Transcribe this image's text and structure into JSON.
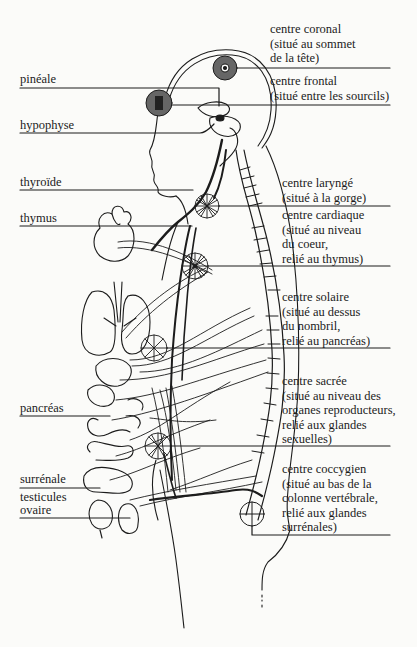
{
  "diagram": {
    "type": "anatomical chakra / endocrine gland diagram",
    "colors": {
      "ink": "#1c1c1c",
      "paper": "#fbfbf9",
      "chakra_fill": "#555555"
    },
    "left_labels": [
      {
        "id": "pineale",
        "text": "pinéale"
      },
      {
        "id": "hypophyse",
        "text": "hypophyse"
      },
      {
        "id": "thyroide",
        "text": "thyroïde"
      },
      {
        "id": "thymus",
        "text": "thymus"
      },
      {
        "id": "pancreas",
        "text": "pancréas"
      },
      {
        "id": "surrenale",
        "text": "surrénale"
      },
      {
        "id": "testicules",
        "text": "testicules"
      },
      {
        "id": "ovaire",
        "text": "ovaire"
      }
    ],
    "right_labels": [
      {
        "id": "coronal",
        "lines": [
          "centre coronal",
          "(situé au sommet",
          "de la tête)"
        ]
      },
      {
        "id": "frontal",
        "lines": [
          "centre frontal",
          "(situé entre les sourcils)"
        ]
      },
      {
        "id": "larynge",
        "lines": [
          "centre  laryngé",
          "(situé à la gorge)"
        ]
      },
      {
        "id": "cardiaque",
        "lines": [
          "centre cardiaque",
          "(situé au niveau",
          "du coeur,",
          "relié au thymus)"
        ]
      },
      {
        "id": "solaire",
        "lines": [
          "centre solaire",
          "(situé au dessus",
          "du nombril,",
          "relié au pancréas)"
        ]
      },
      {
        "id": "sacree",
        "lines": [
          "centre sacrée",
          "(situé au niveau des",
          "organes reproducteurs,",
          "relié aux glandes",
          "sexuelles)"
        ]
      },
      {
        "id": "coccygien",
        "lines": [
          "centre coccygien",
          "(situé au bas de la",
          "colonne vertébrale,",
          "relié aux glandes",
          "surrénales)"
        ]
      }
    ]
  }
}
